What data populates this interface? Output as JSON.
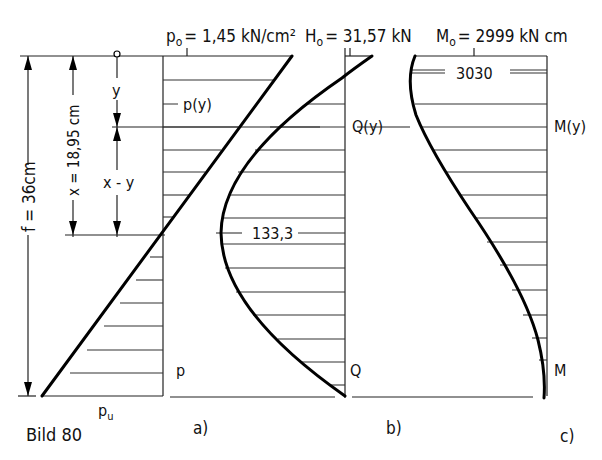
{
  "figure": {
    "caption": "Bild 80",
    "panel_labels": [
      "a)",
      "b)",
      "c)"
    ]
  },
  "dimensions": {
    "f_label": "f =  36cm",
    "x_label": "x = 18,95 cm",
    "y_label": "y",
    "x_minus_y_label": "x - y"
  },
  "panel_a": {
    "top_label_main": "p",
    "top_label_sub": "o",
    "top_label_value": "= 1,45 kN/cm²",
    "mid_label": "p(y)",
    "bottom_label": "p",
    "bottom_value_main": "p",
    "bottom_value_sub": "u"
  },
  "panel_b": {
    "top_label_main": "H",
    "top_label_sub": "o",
    "top_label_value": "= 31,57 kN",
    "mid_label": "Q(y)",
    "peak_value": "133,3",
    "bottom_label": "Q"
  },
  "panel_c": {
    "top_label_main": "M",
    "top_label_sub": "o",
    "top_label_value": "= 2999 kN cm",
    "mid_label": "M(y)",
    "max_value": "3030",
    "bottom_label": "M"
  }
}
